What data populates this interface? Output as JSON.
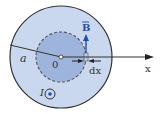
{
  "diagram": {
    "labels": {
      "radius": "a",
      "origin": "0",
      "field": "B",
      "axis": "x",
      "element": "dx",
      "current": "I"
    },
    "colors": {
      "outer_fill": "#c9d8ee",
      "inner_fill": "#9fb4dc",
      "outline": "#333333",
      "field_arrow": "#1f4fa8",
      "current_dot": "#1f4fa8"
    }
  }
}
